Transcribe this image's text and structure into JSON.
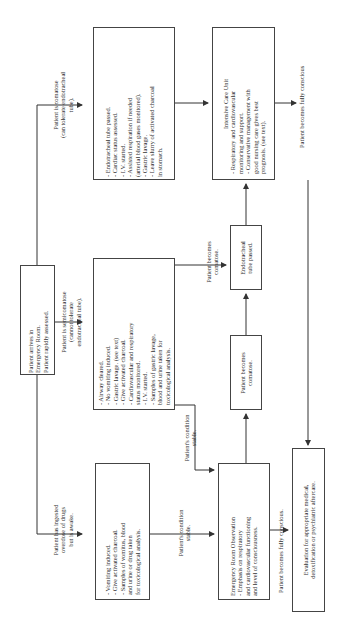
{
  "start": {
    "lines": [
      "Patient arrives in",
      "Emergency Room.",
      "Patient rapidly assessed."
    ]
  },
  "branches": {
    "comatose": {
      "lines": [
        "Patient is comatose",
        "(can tolerate endotracheal",
        "tube)."
      ]
    },
    "semicomatose": {
      "lines": [
        "Patient is semicomatose",
        "(cannot tolerate",
        "endotracheal tube)."
      ]
    },
    "awake": {
      "lines": [
        "Patient has ingested",
        "overdose of drugs",
        "but is awake."
      ]
    }
  },
  "box_comatose": {
    "items": [
      "- Endotracheal tube passed.",
      "- Cardiac status assessed.",
      "- I.V. started.",
      "- Assisted respiration if needed",
      "  (arterial blood gases monitored).",
      "- Gastric lavage.",
      "- Leave slurry of activated charcoal",
      "  in stomach."
    ]
  },
  "box_semicomatose": {
    "items": [
      "- Airway cleared.",
      "- No vomiting induced.",
      "- Gastric lavage. (see text)",
      "- Give activated charcoal.",
      "- Cardiovascular and respiratory",
      "  status monitored.",
      "- I.V. started.",
      "- Samples of gastric lavage,",
      "  blood and urine taken for",
      "  toxicological analysis."
    ]
  },
  "box_awake": {
    "items": [
      "- Vomiting induced.",
      "- Give activated charcoal.",
      "- Samples of vomitus, blood",
      "  and urine or drug taken",
      "  for toxicological analysis."
    ]
  },
  "icu": {
    "title": "Intensive Care Unit",
    "items": [
      "- Respiratory and cardiovascular",
      "  monitoring and support.",
      "- Conservative management with",
      "  good nursing care gives best",
      "  prognosis. (see text)."
    ]
  },
  "endotracheal_box": {
    "lines": [
      "Endotracheal",
      "tube passed."
    ]
  },
  "becomes_comatose_box": {
    "lines": [
      "Patient becomes",
      "comatose."
    ]
  },
  "er_observation": {
    "title": "Emergency Room Observation",
    "items": [
      "- Emphasis on respiratory",
      "  and cardiovascular functioning",
      "  and level of consciousness."
    ]
  },
  "evaluation": {
    "lines": [
      "Evaluation for appropriate medical,",
      "detoxification or psychiatric aftercare."
    ]
  },
  "edge_labels": {
    "becomes_comatose": [
      "Patient becomes",
      "comatose."
    ],
    "condition_stable_1": [
      "Patient's condition",
      "stable."
    ],
    "condition_stable_2": [
      "Patient's condition",
      "stable."
    ],
    "fully_conscious_icu": [
      "Patient becomes fully conscious"
    ],
    "fully_conscious_er": [
      "Patient becomes fully conscious."
    ]
  }
}
